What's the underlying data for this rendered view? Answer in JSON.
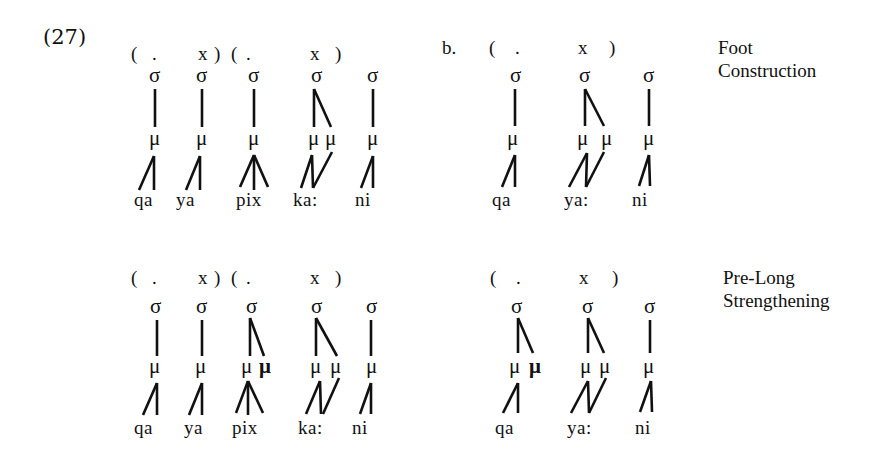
{
  "example_number": "(27)",
  "sub_label_b": "b.",
  "labels": {
    "foot_construction": [
      "Foot",
      "Construction"
    ],
    "pre_long_strengthening": [
      "Pre-Long",
      "Strengthening"
    ]
  },
  "symbols": {
    "syllable": "σ",
    "mora": "μ"
  },
  "panels": {
    "a_top": {
      "grid": [
        "(",
        ".",
        "x",
        ")",
        "(",
        ".",
        "x",
        ")"
      ],
      "segments": [
        "qa",
        "ya",
        "pix",
        "ka:",
        "ni"
      ]
    },
    "b_top": {
      "grid": [
        "(",
        ".",
        "x",
        ")"
      ],
      "segments": [
        "qa",
        "ya:",
        "ni"
      ]
    },
    "a_bottom": {
      "grid": [
        "(",
        ".",
        "x",
        ")",
        "(",
        ".",
        "x",
        ")"
      ],
      "segments": [
        "qa",
        "ya",
        "pix",
        "ka:",
        "ni"
      ]
    },
    "b_bottom": {
      "grid": [
        "(",
        ".",
        "x",
        ")"
      ],
      "segments": [
        "qa",
        "ya:",
        "ni"
      ]
    }
  }
}
